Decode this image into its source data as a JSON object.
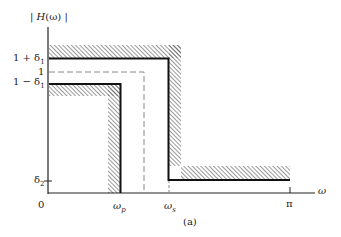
{
  "diagram": {
    "type": "lowpass-filter-tolerance-scheme",
    "y_axis_label": "| H(ω) |",
    "x_axis_label": "ω",
    "y_ticks": [
      "1 + δ1",
      "1",
      "1 − δ1",
      "δ2"
    ],
    "x_ticks": [
      "0",
      "ωp",
      "ωs",
      "π"
    ],
    "caption": "(a)",
    "colors": {
      "line": "#111111",
      "hatch": "#555555",
      "dashed": "#888888"
    }
  },
  "labels": {
    "ylabel": "| H(ω) |",
    "one_plus": "1 + δ",
    "one_plus_sub": "1",
    "one": "1",
    "one_minus": "1 − δ",
    "one_minus_sub": "1",
    "delta2": "δ",
    "delta2_sub": "2",
    "zero": "0",
    "wp": "ω",
    "wp_sub": "p",
    "ws": "ω",
    "ws_sub": "s",
    "pi": "π",
    "omega": "ω",
    "caption": "(a)"
  }
}
